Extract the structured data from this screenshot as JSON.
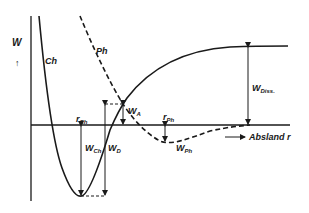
{
  "diagram": {
    "colors": {
      "ink": "#1a1a1a",
      "background": "#ffffff"
    },
    "axes": {
      "y_label": "W",
      "y_arrow": "↑",
      "x_label": "Absland r",
      "x_arrow": "⟶"
    },
    "curves": {
      "chemisorption": {
        "label": "Ch",
        "style": "solid"
      },
      "physisorption": {
        "label": "Ph",
        "style": "dashed"
      }
    },
    "annotations": {
      "r_ch": {
        "main": "r",
        "sub": "Ch"
      },
      "r_ph": {
        "main": "r",
        "sub": "Ph"
      },
      "w_ch": {
        "main": "W",
        "sub": "Ch"
      },
      "w_d": {
        "main": "W",
        "sub": "D"
      },
      "w_a": {
        "main": "W",
        "sub": "A"
      },
      "w_ph": {
        "main": "W",
        "sub": "Ph"
      },
      "w_diss": {
        "main": "W",
        "sub": "Diss."
      }
    }
  }
}
